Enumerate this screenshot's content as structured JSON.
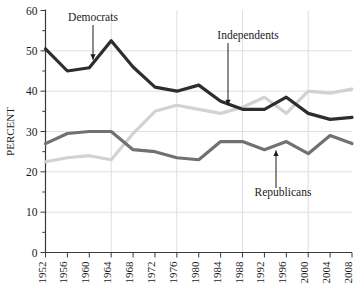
{
  "chart_data": {
    "type": "line",
    "title": "",
    "xlabel": "",
    "ylabel": "PERCENT",
    "x": [
      1952,
      1956,
      1960,
      1964,
      1968,
      1972,
      1976,
      1980,
      1984,
      1988,
      1992,
      1996,
      2000,
      2004,
      2008
    ],
    "categories": [
      "1952",
      "1956",
      "1960",
      "1964",
      "1968",
      "1972",
      "1976",
      "1980",
      "1984",
      "1988",
      "1992",
      "1996",
      "2000",
      "2004",
      "2008"
    ],
    "ylim": [
      0,
      60
    ],
    "xlim": [
      1952,
      2008
    ],
    "yticks": [
      0,
      10,
      20,
      30,
      40,
      50,
      60
    ],
    "ytick_labels": [
      "0",
      "10",
      "20",
      "30",
      "40",
      "50",
      "60"
    ],
    "yminor_step": 5,
    "grid": "both",
    "gridlines_y": [
      10,
      20,
      30,
      40,
      50
    ],
    "gridlines_x": [
      1964,
      1976,
      1988,
      2000
    ],
    "legend_position": "inline-annotations",
    "series": [
      {
        "name": "Democrats",
        "color": "#2d2d2d",
        "values": [
          50.5,
          45.0,
          45.8,
          52.5,
          46.0,
          41.0,
          40.0,
          41.5,
          37.5,
          35.5,
          35.5,
          38.5,
          34.5,
          33.0,
          33.5
        ]
      },
      {
        "name": "Independents",
        "color": "#d2d2d2",
        "values": [
          22.5,
          23.5,
          24.0,
          23.0,
          29.5,
          35.0,
          36.5,
          35.5,
          34.5,
          36.0,
          38.5,
          34.5,
          40.0,
          39.5,
          40.5
        ]
      },
      {
        "name": "Republicans",
        "color": "#717171",
        "values": [
          27.0,
          29.5,
          30.0,
          30.0,
          25.5,
          25.0,
          23.5,
          23.0,
          27.5,
          27.5,
          25.5,
          27.5,
          24.5,
          29.0,
          27.0
        ]
      }
    ],
    "annotations": [
      {
        "label": "Democrats",
        "target_x": 1960,
        "target_y": 45.8
      },
      {
        "label": "Independents",
        "target_x": 1984,
        "target_y": 34.5
      },
      {
        "label": "Republicans",
        "target_x": 1996,
        "target_y": 27.5
      }
    ]
  }
}
